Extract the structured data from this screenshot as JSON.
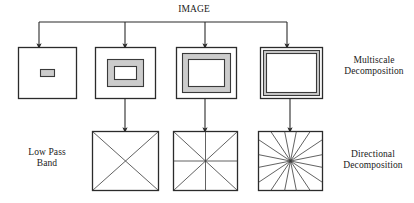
{
  "diagram": {
    "title": "IMAGE",
    "labels": {
      "image": "IMAGE",
      "multiscale": "Multiscale\nDecomposition",
      "directional": "Directional\nDecomposition",
      "lowpass": "Low Pass\nBand"
    },
    "colors": {
      "line": "#2b2b2b",
      "band_fill": "#cccccc",
      "background": "#ffffff"
    },
    "bus": {
      "y": 22,
      "x_start": 39,
      "x_end": 287,
      "drop_x": [
        39,
        125,
        205,
        287
      ],
      "drop_y_end": 46
    },
    "multiscale_boxes": [
      {
        "name": "scale-band-1",
        "x": 18,
        "y": 47,
        "w": 58,
        "h": 51,
        "rings": [
          {
            "inset": 22,
            "fill": "#cccccc"
          }
        ],
        "description": "coarsest scale, small central band"
      },
      {
        "name": "scale-band-2",
        "x": 95,
        "y": 47,
        "w": 60,
        "h": 51,
        "rings": [
          {
            "inset": 12,
            "fill": "#cccccc"
          },
          {
            "inset": 19,
            "fill": "#ffffff"
          }
        ],
        "description": "second scale, annular band"
      },
      {
        "name": "scale-band-3",
        "x": 176,
        "y": 47,
        "w": 60,
        "h": 51,
        "rings": [
          {
            "inset": 6,
            "fill": "#cccccc"
          },
          {
            "inset": 12,
            "fill": "#ffffff"
          }
        ],
        "description": "third scale, thinner annular band"
      },
      {
        "name": "scale-band-4",
        "x": 260,
        "y": 47,
        "w": 62,
        "h": 51,
        "rings": [
          {
            "inset": 3,
            "fill": "#cccccc"
          },
          {
            "inset": 6,
            "fill": "#ffffff"
          }
        ],
        "description": "finest scale, outermost thin band"
      }
    ],
    "directional_boxes": [
      {
        "name": "directional-band-4dir",
        "x": 92,
        "y": 131,
        "w": 66,
        "h": 59,
        "directions": 4,
        "style": "diagonals",
        "source_box": 1
      },
      {
        "name": "directional-band-8dir",
        "x": 173,
        "y": 131,
        "w": 64,
        "h": 59,
        "directions": 8,
        "style": "diagonals-plus-axes",
        "source_box": 2
      },
      {
        "name": "directional-band-16dir",
        "x": 258,
        "y": 131,
        "w": 64,
        "h": 59,
        "directions": 16,
        "style": "radial-fan",
        "source_box": 3
      }
    ],
    "vertical_arrows": [
      {
        "name": "arrow-scale2-to-dir1",
        "x": 125,
        "y_start": 98,
        "y_end": 130
      },
      {
        "name": "arrow-scale3-to-dir2",
        "x": 205,
        "y_start": 98,
        "y_end": 130
      },
      {
        "name": "arrow-scale4-to-dir3",
        "x": 290,
        "y_start": 98,
        "y_end": 130
      }
    ]
  }
}
